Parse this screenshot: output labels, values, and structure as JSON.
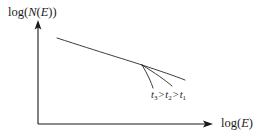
{
  "figure": {
    "type": "schematic-log-log-plot",
    "background_color": "#ffffff",
    "stroke_color": "#1a1a1a"
  },
  "axes": {
    "y_label": {
      "func": "log(",
      "var1": "N",
      "mid": "(",
      "var2": "E",
      "close": "))"
    },
    "x_label": {
      "func": "log(",
      "var": "E",
      "close": ")"
    },
    "origin": {
      "x": 38,
      "y": 124
    },
    "y_axis_top": {
      "x": 38,
      "y": 22
    },
    "x_axis_right": {
      "x": 212,
      "y": 124
    },
    "arrowheads": [
      "y-axis-up",
      "x-axis-right"
    ]
  },
  "annotation": {
    "t3": "t",
    "sub3": "3",
    "gt1": ">",
    "t2": "t",
    "sub2": "2",
    "gt2": ">",
    "t1": "t",
    "sub1": "1"
  },
  "chart_data": {
    "type": "line",
    "title": "",
    "xlabel": "log(E)",
    "ylabel": "log(N(E))",
    "grid": false,
    "legend": "inline-annotation",
    "series": [
      {
        "name": "main power-law",
        "path": [
          [
            57,
            38
          ],
          [
            100,
            52
          ],
          [
            130,
            61
          ],
          [
            142,
            65
          ]
        ]
      },
      {
        "name": "t1",
        "path": [
          [
            142,
            65
          ],
          [
            160,
            71
          ],
          [
            175,
            76
          ],
          [
            185,
            80
          ]
        ]
      },
      {
        "name": "t2",
        "path": [
          [
            142,
            65
          ],
          [
            155,
            73
          ],
          [
            165,
            80
          ],
          [
            172,
            86
          ]
        ]
      },
      {
        "name": "t3",
        "path": [
          [
            142,
            65
          ],
          [
            148,
            75
          ],
          [
            151,
            82
          ],
          [
            153,
            88
          ]
        ]
      }
    ],
    "branch_point": [
      142,
      65
    ],
    "annotation_text": "t3 > t2 > t1"
  }
}
